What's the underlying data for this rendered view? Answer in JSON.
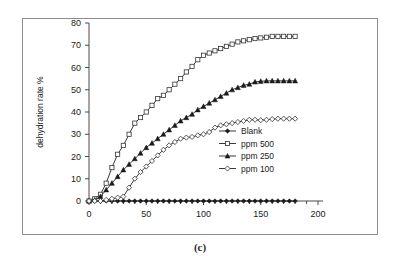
{
  "caption": "(c)",
  "chart_data": {
    "type": "line",
    "title": "",
    "subtitle": "",
    "xlabel": "",
    "ylabel": "dehydration rate %",
    "xlim": [
      0,
      200
    ],
    "ylim": [
      0,
      80
    ],
    "xticks": [
      0,
      50,
      100,
      150,
      200
    ],
    "yticks": [
      0,
      10,
      20,
      30,
      40,
      50,
      60,
      70,
      80
    ],
    "grid": false,
    "legend_position": "inside-right-middle",
    "x": [
      0,
      5,
      10,
      15,
      20,
      25,
      30,
      35,
      40,
      45,
      50,
      55,
      60,
      65,
      70,
      75,
      80,
      85,
      90,
      95,
      100,
      105,
      110,
      115,
      120,
      125,
      130,
      135,
      140,
      145,
      150,
      155,
      160,
      165,
      170,
      175,
      180
    ],
    "series": [
      {
        "name": "Blank",
        "marker": "filled-diamond",
        "values": [
          0,
          0,
          0,
          0,
          0,
          0,
          0,
          0,
          0,
          0,
          0,
          0,
          0,
          0,
          0,
          0,
          0,
          0,
          0,
          0,
          0,
          0,
          0,
          0,
          0,
          0,
          0,
          0,
          0,
          0,
          0,
          0,
          0,
          0,
          0,
          0,
          0
        ]
      },
      {
        "name": "ppm 500",
        "marker": "open-square",
        "values": [
          0,
          1,
          3,
          8,
          15,
          21,
          25,
          30,
          35,
          37.5,
          40,
          43,
          46,
          47.5,
          50,
          52.5,
          55,
          58,
          60.5,
          63.5,
          65.5,
          66.5,
          67.5,
          68.5,
          69.5,
          70.5,
          71.5,
          72,
          72.5,
          73,
          73.3,
          73.6,
          74,
          74,
          74,
          74,
          74
        ]
      },
      {
        "name": "ppm 250",
        "marker": "filled-triangle",
        "values": [
          0,
          0.5,
          2,
          5,
          8,
          11,
          14,
          16.5,
          19,
          21.5,
          24,
          26,
          28,
          30,
          32,
          34,
          36,
          37.5,
          39,
          41,
          42.5,
          44,
          45.5,
          47,
          48.5,
          50,
          51,
          52,
          52.5,
          53.5,
          53.8,
          54,
          54,
          54,
          54,
          54,
          54
        ]
      },
      {
        "name": "ppm 100",
        "marker": "open-diamond",
        "values": [
          0,
          0,
          0,
          0.5,
          1,
          1.5,
          2,
          6,
          10,
          13,
          15.5,
          18,
          20.5,
          23,
          25,
          26.5,
          28,
          28.5,
          28.8,
          29.5,
          30,
          31,
          33,
          34,
          34.5,
          35,
          35.5,
          36,
          36.5,
          36.5,
          36.3,
          36.5,
          36.8,
          37,
          37,
          37,
          37
        ]
      }
    ]
  }
}
